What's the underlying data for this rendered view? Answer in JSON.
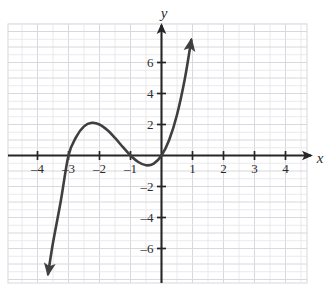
{
  "chart_data": {
    "type": "line",
    "title": "",
    "xlabel": "x",
    "ylabel": "y",
    "xlim": [
      -4.9,
      4.8
    ],
    "ylim": [
      -8.4,
      8.4
    ],
    "grid": true,
    "grid_step": 0.5,
    "legend": "none",
    "x_ticks": [
      -4,
      -3,
      -2,
      -1,
      1,
      2,
      3,
      4
    ],
    "x_tick_labels": [
      "–4",
      "–3",
      "–2",
      "–1",
      "1",
      "2",
      "3",
      "4"
    ],
    "y_ticks": [
      6,
      4,
      2,
      -2,
      -4,
      -6
    ],
    "y_tick_labels": [
      "6",
      "4",
      "2",
      "–2",
      "–4",
      "–6"
    ],
    "axis_arrows": [
      "x-positive",
      "y-positive"
    ],
    "series": [
      {
        "name": "cubic",
        "equation": "y = x(x+1)(x+3)",
        "color": "#3f3f3f",
        "arrow_start": true,
        "arrow_end": true,
        "roots": [
          -3,
          -1,
          0
        ],
        "local_max": {
          "x": -2.12,
          "y": 2.11
        },
        "local_min": {
          "x": -0.45,
          "y": -0.63
        },
        "x_start": -3.66,
        "x_end": 0.96,
        "points": [
          {
            "x": -3.66,
            "y": -7.65
          },
          {
            "x": -3.5,
            "y": -5.63
          },
          {
            "x": -3.25,
            "y": -2.95
          },
          {
            "x": -3.0,
            "y": 0.0
          },
          {
            "x": -2.75,
            "y": 1.2
          },
          {
            "x": -2.5,
            "y": 1.88
          },
          {
            "x": -2.25,
            "y": 2.11
          },
          {
            "x": -2.0,
            "y": 2.0
          },
          {
            "x": -1.75,
            "y": 1.64
          },
          {
            "x": -1.5,
            "y": 1.13
          },
          {
            "x": -1.25,
            "y": 0.55
          },
          {
            "x": -1.0,
            "y": 0.0
          },
          {
            "x": -0.75,
            "y": -0.42
          },
          {
            "x": -0.5,
            "y": -0.63
          },
          {
            "x": -0.25,
            "y": -0.52
          },
          {
            "x": 0.0,
            "y": 0.0
          },
          {
            "x": 0.25,
            "y": 1.02
          },
          {
            "x": 0.5,
            "y": 2.63
          },
          {
            "x": 0.75,
            "y": 4.92
          },
          {
            "x": 0.96,
            "y": 7.45
          }
        ]
      }
    ]
  },
  "colors": {
    "curve": "#3f3f3f",
    "axis": "#262626",
    "grid": "#e4e4e8",
    "grid_major": "#d8d8de",
    "text": "#2b2b2b",
    "background": "#ffffff"
  },
  "labels": {
    "x_axis": "x",
    "y_axis": "y"
  }
}
